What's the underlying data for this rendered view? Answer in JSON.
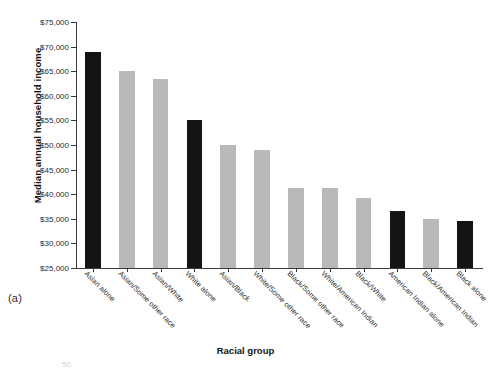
{
  "figure": {
    "panel_label": "(a)",
    "next_panel_partial": "50"
  },
  "chart_data": {
    "type": "bar",
    "title": "",
    "xlabel": "Racial group",
    "ylabel": "Median annual household income",
    "ylim": [
      25000,
      75000
    ],
    "ytick_values": [
      25000,
      30000,
      35000,
      40000,
      45000,
      50000,
      55000,
      60000,
      65000,
      70000,
      75000
    ],
    "ytick_labels": [
      "$25,000",
      "$30,000",
      "$35,000",
      "$40,000",
      "$45,000",
      "$50,000",
      "$55,000",
      "$60,000",
      "$65,000",
      "$70,000",
      "$75,000"
    ],
    "grid": false,
    "legend": "none",
    "categories": [
      "Asian alone",
      "Asian/Some other race",
      "Asian/White",
      "White alone",
      "Asian/Black",
      "White/Some other race",
      "Black/Some other race",
      "White/American Indian",
      "Black/White",
      "American Indian alone",
      "Black/American Indian",
      "Black alone"
    ],
    "values": [
      69000,
      65100,
      63500,
      55000,
      50000,
      49000,
      41200,
      41200,
      39300,
      36500,
      35000,
      34500
    ],
    "bar_colors": [
      "#141414",
      "#b9b9b9",
      "#b9b9b9",
      "#141414",
      "#b9b9b9",
      "#b9b9b9",
      "#b9b9b9",
      "#b9b9b9",
      "#b9b9b9",
      "#141414",
      "#b9b9b9",
      "#141414"
    ]
  },
  "colors": {
    "single_race": "#141414",
    "multi_race": "#b9b9b9",
    "axis": "#3a3a3a",
    "background": "#ffffff"
  }
}
